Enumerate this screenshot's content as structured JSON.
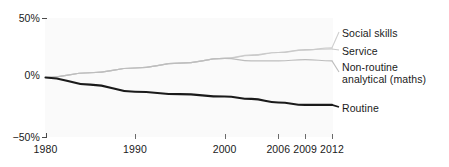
{
  "chart_data": {
    "type": "line",
    "title": "",
    "xlabel": "",
    "ylabel": "",
    "xlim": [
      1980,
      2012
    ],
    "ylim": [
      -50,
      50
    ],
    "grid": false,
    "legend_position": "right-inline",
    "y_ticks": [
      {
        "value": 50,
        "label": "50%"
      },
      {
        "value": 0,
        "label": "0%"
      },
      {
        "value": -50,
        "label": "−50%"
      }
    ],
    "x_ticks": [
      {
        "value": 1980,
        "label": "1980"
      },
      {
        "value": 1990,
        "label": "1990"
      },
      {
        "value": 2000,
        "label": "2000"
      },
      {
        "value": 2006,
        "label": "2006"
      },
      {
        "value": 2009,
        "label": "2009"
      },
      {
        "value": 2012,
        "label": "2012"
      }
    ],
    "x": [
      1980,
      1985,
      1990,
      1995,
      2000,
      2003,
      2006,
      2009,
      2012
    ],
    "series": [
      {
        "name": "Social skills",
        "color": "#cfcfcf",
        "values": [
          0,
          4,
          8,
          12,
          16,
          19,
          21,
          23,
          25
        ]
      },
      {
        "name": "Service",
        "color": "#c9c9c9",
        "values": [
          0,
          4,
          8,
          12,
          16,
          18.5,
          21,
          23.5,
          24
        ]
      },
      {
        "name": "Non-routine analytical (maths)",
        "color": "#bdbdbd",
        "values": [
          0,
          4,
          8,
          12,
          16,
          14,
          14,
          15,
          14
        ]
      },
      {
        "name": "Routine",
        "color": "#1a1a1a",
        "values": [
          0,
          -6,
          -12,
          -14,
          -16,
          -18,
          -21,
          -23,
          -23
        ]
      }
    ]
  },
  "axes": {
    "y_top_label": "50%",
    "y_mid_label": "0%",
    "y_bottom_label": "−50%"
  },
  "legend": {
    "social_skills": "Social skills",
    "service": "Service",
    "non_routine_line1": "Non-routine",
    "non_routine_line2": "analytical (maths)",
    "routine": "Routine"
  }
}
